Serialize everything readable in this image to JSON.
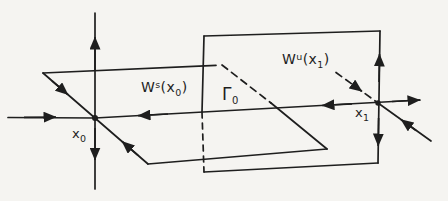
{
  "figure": {
    "background_color": "#f5f4f1",
    "ink_color": "#1e1e1e",
    "labels": {
      "stable_manifold": {
        "base": "W",
        "sup": "s",
        "arg_open": "(x",
        "arg_sub": "0",
        "arg_close": ")"
      },
      "unstable_manifold": {
        "base": "W",
        "sup": "u",
        "arg_open": "(x",
        "arg_sub": "1",
        "arg_close": ")"
      },
      "gamma_orbit": {
        "base": "Γ",
        "sub": "0"
      },
      "fixed_point_x0": {
        "base": "x",
        "sub": "0"
      },
      "fixed_point_x1": {
        "base": "x",
        "sub": "1"
      }
    }
  }
}
